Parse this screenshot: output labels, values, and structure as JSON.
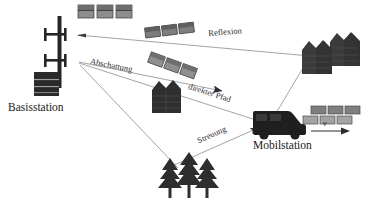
{
  "figure": {
    "type": "radio-propagation-diagram",
    "language": "de",
    "background_color": "#ffffff",
    "line_color": "#8a8a8a",
    "ink_color": "#2b2b2b"
  },
  "labels": {
    "base_station": "Basisstation",
    "mobile_station": "Mobilstation",
    "velocity": "v"
  },
  "paths": [
    {
      "id": "reflexion",
      "label": "Reflexion",
      "from": "buildings-right",
      "to": "antenna-upper"
    },
    {
      "id": "abschattung",
      "label": "Abschattung",
      "from": "antenna-lower",
      "to": "house-center"
    },
    {
      "id": "direkter-pfad",
      "label": "direkter Pfad",
      "from": "antenna-lower",
      "to": "mobile-station"
    },
    {
      "id": "streuung",
      "label": "Streuung",
      "from": "trees",
      "to": "mobile-station"
    }
  ],
  "objects": {
    "antenna_mast": "antenna-mast-icon",
    "base_station_box": "base-station-box-icon",
    "top_buildings": "building-row-icon",
    "tilted_buildings_upper": "building-row-tilted-icon",
    "tilted_buildings_lower": "building-row-tilted-icon",
    "right_houses": "house-cluster-icon",
    "center_house": "house-icon",
    "trees": "tree-cluster-icon",
    "van": "van-icon",
    "mobile_buildings": "building-row-icon"
  }
}
